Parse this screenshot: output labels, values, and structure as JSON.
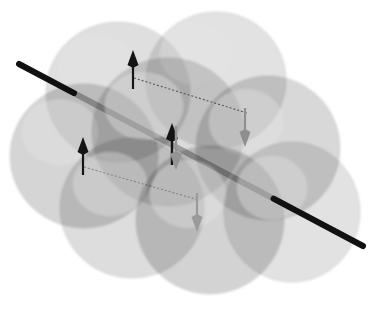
{
  "figure": {
    "title": "Antiferromagnetic spin arrangement on overlapping atomic spheres",
    "kind": "scientific-illustration",
    "width": 379,
    "height": 310,
    "background_color": "#ffffff"
  },
  "palette": {
    "background": "#ffffff",
    "sphere_light": "#d2d2d2",
    "sphere_mid": "#c2c2c2",
    "sphere_dark": "#b0b0b0",
    "sphere_highlight": "#e4e4e4",
    "sphere_edge": "#bdbdbd",
    "arrow_up_color": "#141414",
    "arrow_down_color": "#8e8e8e",
    "axis_color": "#111111",
    "dashed_line_color": "#4d4d4d"
  },
  "spheres": [
    {
      "id": "sphere-back-top-left",
      "cx": 118,
      "cy": 92,
      "rx": 72,
      "ry": 70,
      "shade": "#d2d2d2",
      "opacity": 0.72,
      "highlight_dx": -22,
      "highlight_dy": -26
    },
    {
      "id": "sphere-back-top-right",
      "cx": 216,
      "cy": 80,
      "rx": 70,
      "ry": 68,
      "shade": "#d6d6d6",
      "opacity": 0.7,
      "highlight_dx": -20,
      "highlight_dy": -26
    },
    {
      "id": "sphere-mid-left",
      "cx": 84,
      "cy": 156,
      "rx": 74,
      "ry": 72,
      "shade": "#c6c6c6",
      "opacity": 0.74,
      "highlight_dx": -24,
      "highlight_dy": -24
    },
    {
      "id": "sphere-center",
      "cx": 168,
      "cy": 132,
      "rx": 76,
      "ry": 74,
      "shade": "#cccccc",
      "opacity": 0.7,
      "highlight_dx": -24,
      "highlight_dy": -26
    },
    {
      "id": "sphere-right",
      "cx": 268,
      "cy": 148,
      "rx": 72,
      "ry": 72,
      "shade": "#c9c9c9",
      "opacity": 0.72,
      "highlight_dx": -22,
      "highlight_dy": -26
    },
    {
      "id": "sphere-front-bottom-left",
      "cx": 132,
      "cy": 208,
      "rx": 72,
      "ry": 70,
      "shade": "#cfcfcf",
      "opacity": 0.7,
      "highlight_dx": -22,
      "highlight_dy": -24
    },
    {
      "id": "sphere-front-bottom-mid",
      "cx": 210,
      "cy": 220,
      "rx": 74,
      "ry": 74,
      "shade": "#c4c4c4",
      "opacity": 0.74,
      "highlight_dx": -22,
      "highlight_dy": -26
    },
    {
      "id": "sphere-front-bottom-right",
      "cx": 292,
      "cy": 212,
      "rx": 68,
      "ry": 70,
      "shade": "#d4d4d4",
      "opacity": 0.68,
      "highlight_dx": -20,
      "highlight_dy": -24
    }
  ],
  "axis": {
    "label": "rotation-axis",
    "x1": 19,
    "y1": 64,
    "x2": 363,
    "y2": 246,
    "stroke_width": 6,
    "color": "#111111"
  },
  "spin_arrows": [
    {
      "id": "spin-up-top",
      "direction": "up",
      "color": "#141414",
      "x": 133,
      "y_tail": 89,
      "y_head": 50,
      "shaft_width": 2.2,
      "head_width": 11,
      "head_length": 15
    },
    {
      "id": "spin-up-left",
      "direction": "up",
      "color": "#141414",
      "x": 83,
      "y_tail": 175,
      "y_head": 137,
      "shaft_width": 2.2,
      "head_width": 11,
      "head_length": 15
    },
    {
      "id": "spin-up-center",
      "direction": "up",
      "color": "#141414",
      "x": 172,
      "y_tail": 165,
      "y_head": 123,
      "shaft_width": 2.4,
      "head_width": 12,
      "head_length": 16
    },
    {
      "id": "spin-down-center",
      "direction": "down",
      "color": "#949494",
      "x": 176,
      "y_tail": 126,
      "y_head": 170,
      "shaft_width": 2.4,
      "head_width": 12,
      "head_length": 16
    },
    {
      "id": "spin-down-right",
      "direction": "down",
      "color": "#8e8e8e",
      "x": 245,
      "y_tail": 108,
      "y_head": 147,
      "shaft_width": 2.2,
      "head_width": 11,
      "head_length": 15
    },
    {
      "id": "spin-down-bottom",
      "direction": "down",
      "color": "#9a9a9a",
      "x": 197,
      "y_tail": 193,
      "y_head": 232,
      "shaft_width": 2.2,
      "head_width": 11,
      "head_length": 15
    }
  ],
  "dashed_connectors": [
    {
      "id": "dash-top",
      "x1": 134,
      "y1": 78,
      "x2": 247,
      "y2": 113,
      "color": "#555555",
      "dash": "2 2",
      "stroke_width": 1.1
    },
    {
      "id": "dash-bottom",
      "x1": 84,
      "y1": 167,
      "x2": 199,
      "y2": 200,
      "color": "#555555",
      "dash": "2 2",
      "stroke_width": 1.1
    }
  ],
  "legend": {
    "visible": false,
    "entries": []
  }
}
